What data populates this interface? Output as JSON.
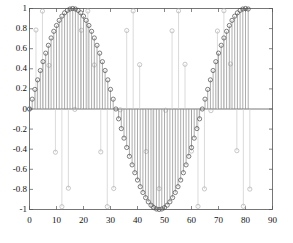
{
  "chart_data": {
    "type": "line",
    "plot_style": "stem",
    "title": "",
    "xlabel": "",
    "ylabel": "",
    "xlim": [
      0,
      90
    ],
    "ylim": [
      -1,
      1
    ],
    "grid": false,
    "legend": null,
    "xticks": [
      0,
      10,
      20,
      30,
      40,
      50,
      60,
      70,
      80,
      90
    ],
    "xtick_labels": [
      "0",
      "10",
      "20",
      "30",
      "40",
      "50",
      "60",
      "70",
      "80",
      "90"
    ],
    "yticks": [
      -1,
      -0.8,
      -0.6,
      -0.4,
      -0.2,
      0,
      0.2,
      0.4,
      0.6,
      0.8,
      1
    ],
    "ytick_labels": [
      "-1",
      "-0.8",
      "-0.6",
      "-0.4",
      "-0.2",
      "0",
      "0.2",
      "0.4",
      "0.6",
      "0.8",
      "1"
    ],
    "axis_color": "#555555",
    "series": [
      {
        "name": "dense-sine",
        "marker": "o",
        "color": "#4a4a4a",
        "stem_color": "#8a8a8a",
        "x": [
          0,
          1,
          2,
          3,
          4,
          5,
          6,
          7,
          8,
          9,
          10,
          11,
          12,
          13,
          14,
          15,
          16,
          17,
          18,
          19,
          20,
          21,
          22,
          23,
          24,
          25,
          26,
          27,
          28,
          29,
          30,
          31,
          32,
          33,
          34,
          35,
          36,
          37,
          38,
          39,
          40,
          41,
          42,
          43,
          44,
          45,
          46,
          47,
          48,
          49,
          50,
          51,
          52,
          53,
          54,
          55,
          56,
          57,
          58,
          59,
          60,
          61,
          62,
          63,
          64,
          65,
          66,
          67,
          68,
          69,
          70,
          71,
          72,
          73,
          74,
          75,
          76,
          77,
          78,
          79,
          80,
          81
        ],
        "y": [
          0.0,
          0.098,
          0.195,
          0.29,
          0.383,
          0.471,
          0.556,
          0.634,
          0.707,
          0.773,
          0.831,
          0.882,
          0.924,
          0.957,
          0.981,
          0.995,
          1.0,
          0.995,
          0.981,
          0.957,
          0.924,
          0.882,
          0.831,
          0.773,
          0.707,
          0.634,
          0.556,
          0.471,
          0.383,
          0.29,
          0.195,
          0.098,
          0.0,
          -0.098,
          -0.195,
          -0.29,
          -0.383,
          -0.471,
          -0.556,
          -0.634,
          -0.707,
          -0.773,
          -0.831,
          -0.882,
          -0.924,
          -0.957,
          -0.981,
          -0.995,
          -1.0,
          -0.995,
          -0.981,
          -0.957,
          -0.924,
          -0.882,
          -0.831,
          -0.773,
          -0.707,
          -0.634,
          -0.556,
          -0.471,
          -0.383,
          -0.29,
          -0.195,
          -0.098,
          0.0,
          0.098,
          0.195,
          0.29,
          0.383,
          0.471,
          0.556,
          0.634,
          0.707,
          0.773,
          0.831,
          0.882,
          0.924,
          0.957,
          0.981,
          0.995,
          1.0,
          0.995
        ]
      },
      {
        "name": "aliased-sine",
        "marker": "o",
        "color": "#b0b0b0",
        "stem_color": "#cccccc",
        "x": [
          0,
          2.4,
          4.8,
          7.2,
          9.6,
          12,
          14.4,
          16.8,
          19.2,
          21.6,
          24,
          26.4,
          28.8,
          31.2,
          33.6,
          36,
          38.4,
          40.8,
          43.2,
          45.6,
          48,
          50.4,
          52.8,
          55.2,
          57.6,
          60,
          62.4,
          64.8,
          67.2,
          69.6,
          72,
          74.4,
          76.8,
          79.2,
          81.6
        ],
        "y": [
          0.0,
          0.786,
          0.974,
          0.434,
          -0.43,
          -0.972,
          -0.788,
          -0.004,
          0.783,
          0.975,
          0.438,
          -0.427,
          -0.971,
          -0.791,
          -0.008,
          0.781,
          0.976,
          0.441,
          -0.423,
          -0.97,
          -0.793,
          -0.012,
          0.778,
          0.977,
          0.445,
          -0.419,
          -0.969,
          -0.795,
          -0.016,
          0.776,
          0.978,
          0.448,
          -0.415,
          -0.968,
          -0.797
        ]
      }
    ]
  }
}
